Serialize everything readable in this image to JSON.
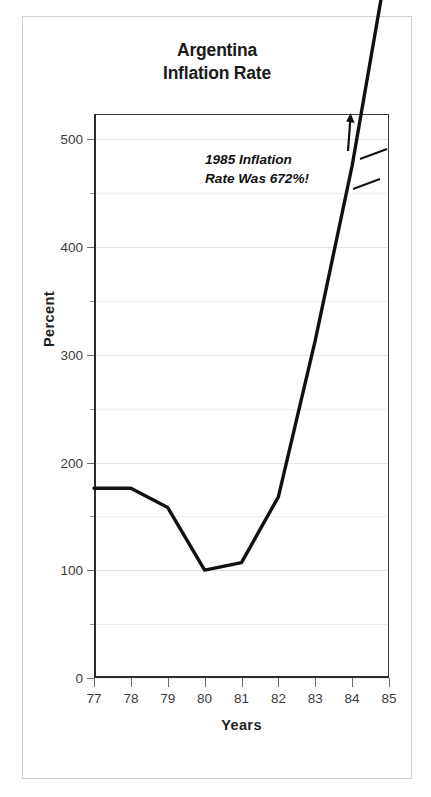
{
  "figure": {
    "title_lines": [
      "Argentina",
      "Inflation Rate"
    ],
    "frame_color": "#cfcfcf",
    "background": "#ffffff"
  },
  "annotation": {
    "lines": [
      "1985 Inflation",
      "Rate Was 672%!"
    ],
    "arrow_icon": "up-arrow-icon",
    "break_icon": "axis-break-icon"
  },
  "axes": {
    "y_title": "Percent",
    "x_title": "Years",
    "y_labels": [
      "0",
      "100",
      "200",
      "300",
      "400",
      "500"
    ],
    "y_label_values": [
      0,
      100,
      200,
      300,
      400,
      500
    ],
    "y_minor_values": [
      50,
      150,
      250,
      350,
      450
    ],
    "x_labels": [
      "77",
      "78",
      "79",
      "80",
      "81",
      "82",
      "83",
      "84",
      "85"
    ]
  },
  "chart_data": {
    "type": "line",
    "title": "Argentina Inflation Rate",
    "xlabel": "Years",
    "ylabel": "Percent",
    "x": [
      "77",
      "78",
      "79",
      "80",
      "81",
      "82",
      "83",
      "84",
      "85"
    ],
    "values": [
      176,
      176,
      158,
      100,
      107,
      168,
      313,
      475,
      672
    ],
    "ylim": [
      0,
      523
    ],
    "xlim": [
      "77",
      "85"
    ],
    "grid": true,
    "gridline_interval": 50,
    "legend": "none",
    "series": [
      {
        "name": "Annual inflation rate (percent)",
        "values": [
          176,
          176,
          158,
          100,
          107,
          168,
          313,
          475,
          672
        ]
      }
    ],
    "annotations": [
      {
        "text": "1985 Inflation Rate Was 672%!",
        "note": "value for 1985 exceeds the plotted y-axis range; line is broken and an arrow points up"
      }
    ],
    "axis_break": {
      "on_series": true,
      "near_x": "84",
      "reason": "1985 value of 672% is off the 0-500 scale"
    }
  }
}
